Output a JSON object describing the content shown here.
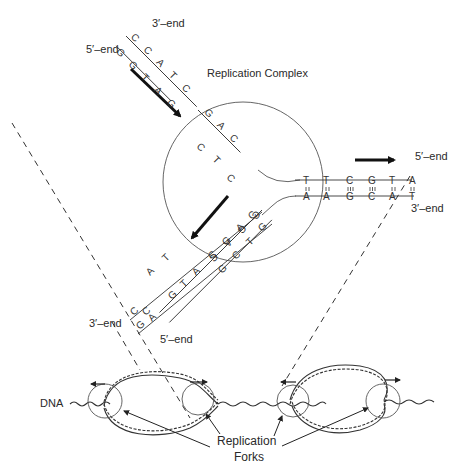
{
  "diagram": {
    "title": "DNA Replication",
    "labels": {
      "replication_complex": "Replication Complex",
      "top_3_end": "3′–end",
      "top_5_end": "5′–end",
      "right_5_end": "5′–end",
      "right_3_end": "3′–end",
      "bottom_3_end": "3′–end",
      "bottom_5_end": "5′–end",
      "dna": "DNA",
      "forks_line1": "Replication",
      "forks_line2": "Forks"
    },
    "parental_strand_upper_left": {
      "outer_strand": [
        "C",
        "C",
        "A",
        "T",
        "C"
      ],
      "inner_strand": [
        "G",
        "G",
        "T",
        "A",
        "G"
      ],
      "unpaired_continuation": [
        "G",
        "A",
        "C"
      ],
      "free_nucleotides": [
        "C",
        "T",
        "C"
      ]
    },
    "parental_duplex_right": {
      "top_strand": [
        "T",
        "T",
        "C",
        "G",
        "T",
        "A"
      ],
      "bottom_strand": [
        "A",
        "A",
        "G",
        "C",
        "A",
        "T"
      ],
      "bond_types": [
        "double",
        "double",
        "triple",
        "triple",
        "double",
        "double"
      ]
    },
    "daughter_lower_left": {
      "template_strand": [
        "C",
        "G",
        "A",
        "C"
      ],
      "new_strand": [
        "G",
        "C",
        "T",
        "G"
      ],
      "outer_strand": [
        "C",
        "C",
        "A",
        "T",
        "G"
      ],
      "inner_strand": [
        "G",
        "G",
        "T",
        "A",
        "C"
      ],
      "free_nucleotides": [
        "A",
        "T"
      ]
    },
    "bubbles": {
      "count": 2,
      "forks_per_bubble": 2,
      "direction_arrows": [
        "left",
        "right",
        "left",
        "right"
      ]
    }
  }
}
